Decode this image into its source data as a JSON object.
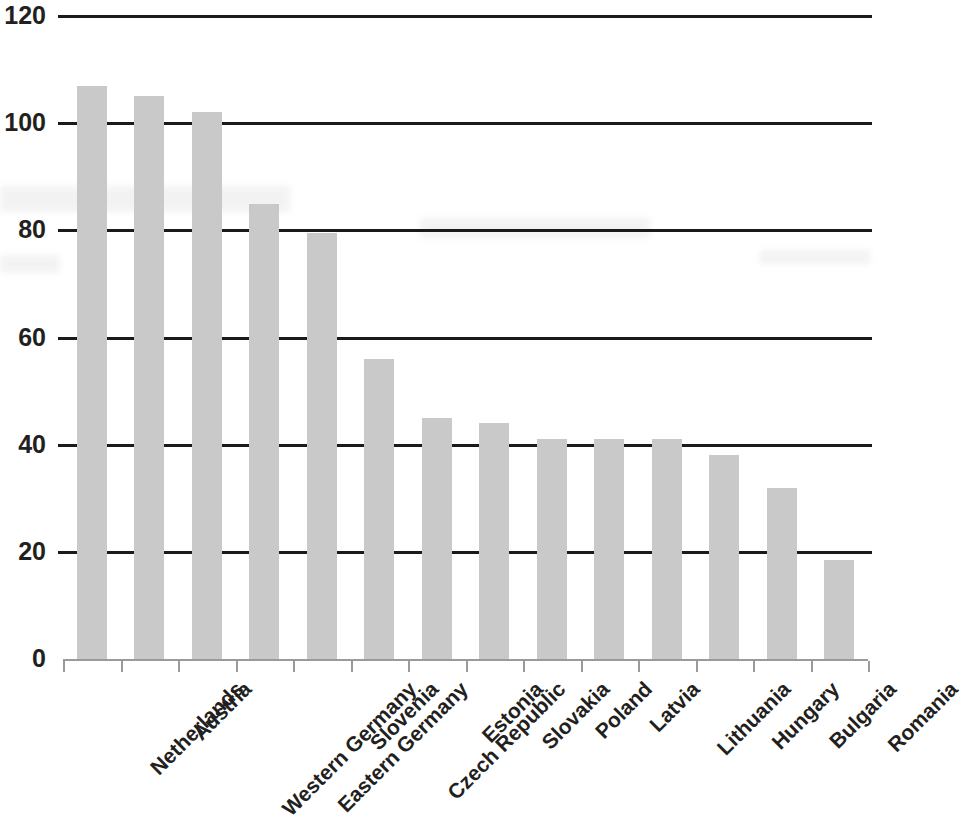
{
  "chart_data": {
    "type": "bar",
    "title": "",
    "subtitle": "",
    "xlabel": "",
    "ylabel": "",
    "categories": [
      "Netherlands",
      "Austria",
      "Western Germany",
      "Eastern Germany",
      "Slovenia",
      "Czech Republic",
      "Estonia",
      "Slovakia",
      "Poland",
      "Latvia",
      "Lithuania",
      "Hungary",
      "Bulgaria",
      "Romania"
    ],
    "values": [
      107,
      105,
      102,
      85,
      79.5,
      56,
      45,
      44,
      41,
      41,
      41,
      38,
      32,
      18.5
    ],
    "ylim": [
      0,
      120
    ],
    "yticks": [
      0,
      20,
      40,
      60,
      80,
      100,
      120
    ],
    "ytick_labels": [
      "0",
      "20",
      "40",
      "60",
      "80",
      "100",
      "120"
    ],
    "grid": true,
    "grid_axis": "y",
    "legend": false,
    "legend_position": "none",
    "bar_color": "#c9c9c9",
    "grid_color": "#1a1a1a",
    "text_color": "#231f20",
    "background_color": "#ffffff",
    "series": [
      {
        "name": "",
        "values": [
          107,
          105,
          102,
          85,
          79.5,
          56,
          45,
          44,
          41,
          41,
          41,
          38,
          32,
          18.5
        ]
      }
    ]
  }
}
